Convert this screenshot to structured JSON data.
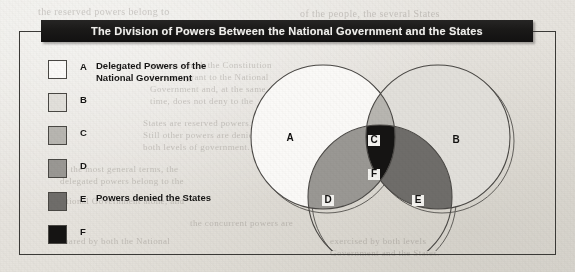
{
  "page": {
    "background_color": "#e7e4df",
    "bleed_through_lines": [
      {
        "text": "the reserved powers belong to",
        "x": 38,
        "y": 6,
        "size": 10
      },
      {
        "text": "of the people, the several States",
        "x": 300,
        "y": 8,
        "size": 10
      },
      {
        "text": "powers which the Constitution",
        "x": 150,
        "y": 60,
        "size": 9
      },
      {
        "text": "does not grant to the National",
        "x": 150,
        "y": 72,
        "size": 9
      },
      {
        "text": "Government and, at the same",
        "x": 150,
        "y": 84,
        "size": 9
      },
      {
        "text": "time, does not deny to the",
        "x": 150,
        "y": 96,
        "size": 9
      },
      {
        "text": "States are reserved powers.",
        "x": 143,
        "y": 118,
        "size": 9
      },
      {
        "text": "Still other powers are denied to",
        "x": 143,
        "y": 130,
        "size": 9
      },
      {
        "text": "both levels of government.",
        "x": 143,
        "y": 142,
        "size": 9
      },
      {
        "text": "in the most general terms, the",
        "x": 60,
        "y": 164,
        "size": 9
      },
      {
        "text": "delegated powers belong to the",
        "x": 60,
        "y": 176,
        "size": 9
      },
      {
        "text": "National Government alone, and",
        "x": 55,
        "y": 196,
        "size": 9
      },
      {
        "text": "the concurrent powers are",
        "x": 190,
        "y": 218,
        "size": 9
      },
      {
        "text": "shared by both the National",
        "x": 60,
        "y": 236,
        "size": 9
      },
      {
        "text": "Government and the States.",
        "x": 330,
        "y": 248,
        "size": 9
      },
      {
        "text": "exercised by both levels",
        "x": 330,
        "y": 236,
        "size": 9
      }
    ]
  },
  "figure": {
    "title": "The Division of Powers Between the National Government and the States",
    "title_bar_color": "#1a1918",
    "title_text_color": "#f2f1ee",
    "frame_color": "#3b3a37"
  },
  "legend": {
    "items": [
      {
        "key": "A",
        "label": "Delegated Powers of the\nNational Government",
        "color": "#fbfaf8"
      },
      {
        "key": "B",
        "label": "",
        "color": "#e2e0db"
      },
      {
        "key": "C",
        "label": "",
        "color": "#b8b6b1"
      },
      {
        "key": "D",
        "label": "",
        "color": "#9a9894"
      },
      {
        "key": "E",
        "label": "Powers denied the States",
        "color": "#6f6d6a"
      },
      {
        "key": "F",
        "label": "",
        "color": "#151413"
      }
    ]
  },
  "venn": {
    "type": "venn-3-circle",
    "circles": [
      {
        "id": "left",
        "label": "A",
        "cx": 95,
        "cy": 82,
        "r": 72
      },
      {
        "id": "right",
        "label": "B",
        "cx": 210,
        "cy": 82,
        "r": 72
      },
      {
        "id": "bottom",
        "label": "D-E",
        "cx": 152,
        "cy": 142,
        "r": 72
      }
    ],
    "regions": [
      {
        "key": "A",
        "description": "left circle only",
        "color": "#fbfaf8",
        "label_x": 62,
        "label_y": 86,
        "boxed": false
      },
      {
        "key": "B",
        "description": "right circle only",
        "color": "#e2e0db",
        "label_x": 228,
        "label_y": 88,
        "boxed": false
      },
      {
        "key": "C",
        "description": "left and right overlap",
        "color": "#b8b6b1",
        "label_x": 146,
        "label_y": 88,
        "boxed": true
      },
      {
        "key": "D",
        "description": "left and bottom overlap",
        "color": "#9a9894",
        "label_x": 100,
        "label_y": 148,
        "boxed": true
      },
      {
        "key": "E",
        "description": "right and bottom overlap",
        "color": "#6f6d6a",
        "label_x": 190,
        "label_y": 148,
        "boxed": true
      },
      {
        "key": "F",
        "description": "all three circles overlap",
        "color": "#151413",
        "label_x": 146,
        "label_y": 122,
        "boxed": true
      }
    ],
    "outline_color": "#4a4845",
    "ghost_outline_color": "#62605c"
  }
}
